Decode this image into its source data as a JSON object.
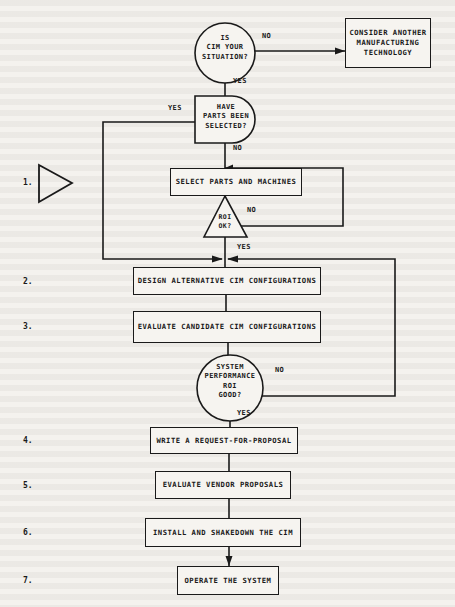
{
  "flowchart": {
    "decisions": {
      "cim_situation": "IS\nCIM YOUR\nSITUATION?",
      "parts_selected": "HAVE\nPARTS BEEN\nSELECTED?",
      "roi_ok": "ROI\nOK?",
      "system_good": "SYSTEM\nPERFORMANCE\nROI\nGOOD?"
    },
    "terminal": {
      "consider_another": "CONSIDER ANOTHER\nMANUFACTURING\nTECHNOLOGY"
    },
    "processes": [
      {
        "step": "1.",
        "label": "SELECT PARTS AND MACHINES"
      },
      {
        "step": "2.",
        "label": "DESIGN ALTERNATIVE CIM CONFIGURATIONS"
      },
      {
        "step": "3.",
        "label": "EVALUATE CANDIDATE CIM CONFIGURATIONS"
      },
      {
        "step": "4.",
        "label": "WRITE A REQUEST-FOR-PROPOSAL"
      },
      {
        "step": "5.",
        "label": "EVALUATE VENDOR PROPOSALS"
      },
      {
        "step": "6.",
        "label": "INSTALL AND SHAKEDOWN THE CIM"
      },
      {
        "step": "7.",
        "label": "OPERATE THE SYSTEM"
      }
    ],
    "edge_labels": {
      "cim_no": "NO",
      "cim_yes": "YES",
      "parts_yes": "YES",
      "parts_no": "NO",
      "roi_no": "NO",
      "roi_yes": "YES",
      "system_no": "NO",
      "system_yes": "YES"
    },
    "colors": {
      "ink": "#1a1a1a",
      "paper": "#f4f2ee"
    }
  }
}
